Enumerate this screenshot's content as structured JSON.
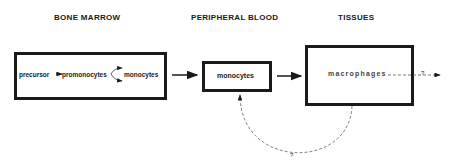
{
  "headers": {
    "bone_marrow": "BONE MARROW",
    "peripheral_blood": "PERIPHERAL BLOOD",
    "tissues": "TISSUES"
  },
  "bone_marrow_box": {
    "precursor": "precursor",
    "promonocytes": "promonocytes",
    "monocytes": "monocytes"
  },
  "blood_box": {
    "monocytes": "monocytes"
  },
  "tissue_box": {
    "macrophages": "macrophages"
  },
  "unknown_fate_label": "?",
  "return_path_label": "?"
}
